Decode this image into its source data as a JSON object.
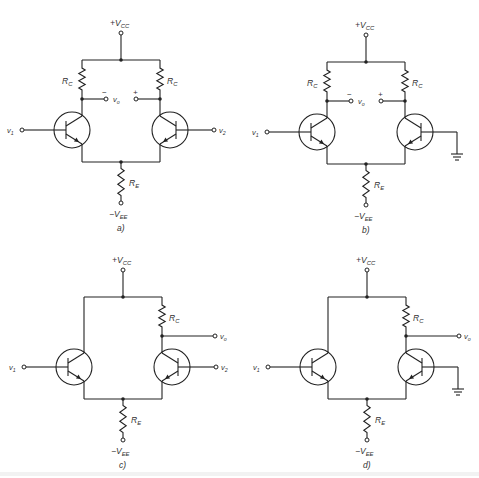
{
  "figure": {
    "panels": [
      {
        "id": "a",
        "label": "a)",
        "supply_pos": "+V",
        "supply_pos_sub": "CC",
        "supply_neg": "−V",
        "supply_neg_sub": "EE",
        "rc_label": "R",
        "rc_sub": "C",
        "re_label": "R",
        "re_sub": "E",
        "in1": "v",
        "in1_sub": "1",
        "in2": "v",
        "in2_sub": "2",
        "out": "v",
        "out_sub": "o",
        "minus": "−",
        "plus": "+"
      },
      {
        "id": "b",
        "label": "b)",
        "supply_pos": "+V",
        "supply_pos_sub": "CC",
        "supply_neg": "−V",
        "supply_neg_sub": "EE",
        "rc_label": "R",
        "rc_sub": "C",
        "re_label": "R",
        "re_sub": "E",
        "in1": "v",
        "in1_sub": "1",
        "out": "v",
        "out_sub": "o",
        "minus": "−",
        "plus": "+",
        "ground_icon": "ground-icon"
      },
      {
        "id": "c",
        "label": "c)",
        "supply_pos": "+V",
        "supply_pos_sub": "CC",
        "supply_neg": "−V",
        "supply_neg_sub": "EE",
        "rc_label": "R",
        "rc_sub": "C",
        "re_label": "R",
        "re_sub": "E",
        "in1": "v",
        "in1_sub": "1",
        "in2": "v",
        "in2_sub": "2",
        "out": "v",
        "out_sub": "o"
      },
      {
        "id": "d",
        "label": "d)",
        "supply_pos": "+V",
        "supply_pos_sub": "CC",
        "supply_neg": "−V",
        "supply_neg_sub": "EE",
        "rc_label": "R",
        "rc_sub": "C",
        "re_label": "R",
        "re_sub": "E",
        "in1": "v",
        "in1_sub": "1",
        "out": "v",
        "out_sub": "o",
        "ground_icon": "ground-icon"
      }
    ],
    "components": {
      "transistor_icon": "npn-transistor-icon",
      "resistor_icon": "resistor-icon",
      "terminal_icon": "terminal-circle-icon",
      "node_icon": "junction-dot-icon"
    }
  }
}
